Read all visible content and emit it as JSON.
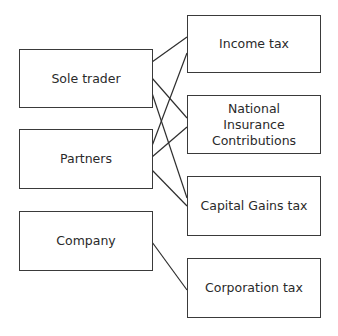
{
  "diagram": {
    "left_nodes": [
      {
        "id": "sole_trader",
        "label": "Sole trader"
      },
      {
        "id": "partners",
        "label": "Partners"
      },
      {
        "id": "company",
        "label": "Company"
      }
    ],
    "right_nodes": [
      {
        "id": "income_tax",
        "label": "Income tax"
      },
      {
        "id": "nic",
        "label": "National Insurance Contributions"
      },
      {
        "id": "cgt",
        "label": "Capital Gains tax"
      },
      {
        "id": "corp_tax",
        "label": "Corporation tax"
      }
    ],
    "edges": [
      {
        "from": "sole_trader",
        "to": "income_tax"
      },
      {
        "from": "sole_trader",
        "to": "nic"
      },
      {
        "from": "sole_trader",
        "to": "cgt"
      },
      {
        "from": "partners",
        "to": "income_tax"
      },
      {
        "from": "partners",
        "to": "nic"
      },
      {
        "from": "partners",
        "to": "cgt"
      },
      {
        "from": "company",
        "to": "corp_tax"
      }
    ],
    "line_color": "#2e2e2e",
    "border_color": "#3a3a3a"
  }
}
